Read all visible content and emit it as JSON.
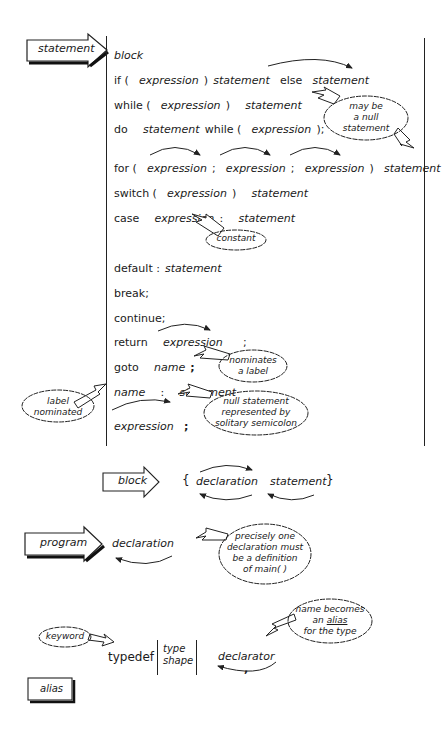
{
  "statement_section": {
    "label": "statement",
    "rows": [
      {
        "parts": [
          {
            "t": "i",
            "v": "block"
          }
        ]
      },
      {
        "parts": [
          {
            "t": "k",
            "v": "if ("
          },
          {
            "t": "i",
            "v": "expression"
          },
          {
            "t": "k",
            "v": ")"
          },
          {
            "t": "i",
            "v": "statement"
          },
          {
            "t": "k",
            "v": "else"
          },
          {
            "t": "i",
            "v": "statement"
          }
        ]
      },
      {
        "parts": [
          {
            "t": "k",
            "v": "while ("
          },
          {
            "t": "i",
            "v": "expression"
          },
          {
            "t": "k",
            "v": ")"
          },
          {
            "t": "i",
            "v": "statement"
          }
        ]
      },
      {
        "parts": [
          {
            "t": "k",
            "v": "do"
          },
          {
            "t": "i",
            "v": "statement"
          },
          {
            "t": "k",
            "v": "while ("
          },
          {
            "t": "i",
            "v": "expression"
          },
          {
            "t": "k",
            "v": ");"
          }
        ]
      },
      {
        "parts": [
          {
            "t": "k",
            "v": "for ("
          },
          {
            "t": "i",
            "v": "expression"
          },
          {
            "t": "k",
            "v": ";"
          },
          {
            "t": "i",
            "v": "expression"
          },
          {
            "t": "k",
            "v": ";"
          },
          {
            "t": "i",
            "v": "expression"
          },
          {
            "t": "k",
            "v": ")"
          },
          {
            "t": "i",
            "v": "statement"
          }
        ]
      },
      {
        "parts": [
          {
            "t": "k",
            "v": "switch ("
          },
          {
            "t": "i",
            "v": "expression"
          },
          {
            "t": "k",
            "v": ")"
          },
          {
            "t": "i",
            "v": "statement"
          }
        ]
      },
      {
        "parts": [
          {
            "t": "k",
            "v": "case"
          },
          {
            "t": "i",
            "v": "expression"
          },
          {
            "t": "k",
            "v": ":"
          },
          {
            "t": "i",
            "v": "statement"
          }
        ]
      },
      {
        "parts": [
          {
            "t": "k",
            "v": "default :"
          },
          {
            "t": "i",
            "v": "statement"
          }
        ]
      },
      {
        "parts": [
          {
            "t": "k",
            "v": "break;"
          }
        ]
      },
      {
        "parts": [
          {
            "t": "k",
            "v": "continue;"
          }
        ]
      },
      {
        "parts": [
          {
            "t": "k",
            "v": "return"
          },
          {
            "t": "i",
            "v": "expression"
          },
          {
            "t": "k",
            "v": ";"
          }
        ]
      },
      {
        "parts": [
          {
            "t": "k",
            "v": "goto"
          },
          {
            "t": "i",
            "v": "name"
          },
          {
            "t": "k",
            "v": ";"
          }
        ]
      },
      {
        "parts": [
          {
            "t": "i",
            "v": "name"
          },
          {
            "t": "k",
            "v": ":"
          },
          {
            "t": "i",
            "v": "statement"
          }
        ]
      },
      {
        "parts": [
          {
            "t": "i",
            "v": "expression"
          },
          {
            "t": "k",
            "v": ";"
          }
        ]
      }
    ],
    "notes": {
      "null_statement": [
        "may be",
        "a null",
        "statement"
      ],
      "constant": "constant",
      "nominates_label": [
        "nominates",
        "a label"
      ],
      "label_nominated": [
        "label",
        "nominated"
      ],
      "null_semicolon": [
        "null statement",
        "represented by",
        "solitary semicolon"
      ]
    }
  },
  "block_section": {
    "label": "block",
    "open_brace": "{",
    "declaration": "declaration",
    "statement": "statement",
    "close_brace": "}"
  },
  "program_section": {
    "label": "program",
    "declaration": "declaration",
    "note": [
      "precisely one",
      "declaration must",
      "be a definition",
      "of main( )"
    ]
  },
  "typedef_section": {
    "keyword_note": "keyword",
    "keyword": "typedef",
    "type_shape": [
      "type",
      "shape"
    ],
    "declarator": "declarator",
    "separator": ",",
    "alias_note_line1": "name becomes",
    "alias_note_an": "an",
    "alias_note_alias": "alias",
    "alias_note_line3": "for the type",
    "label": "alias"
  }
}
